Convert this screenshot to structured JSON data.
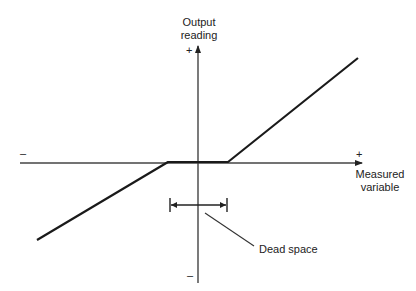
{
  "diagram": {
    "type": "dead-space-characteristic",
    "y_axis": {
      "label_line1": "Output",
      "label_line2": "reading",
      "positive": "+",
      "negative": "–"
    },
    "x_axis": {
      "label_line1": "Measured",
      "label_line2": "variable",
      "positive": "+",
      "negative": "–"
    },
    "annotation": {
      "label": "Dead space"
    },
    "colors": {
      "line": "#1a1a1a",
      "axis": "#333333",
      "background": "#ffffff"
    }
  }
}
